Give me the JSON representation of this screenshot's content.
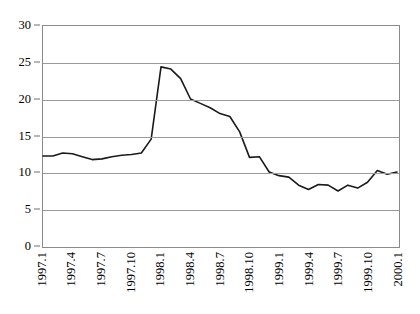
{
  "chart_data": {
    "type": "line",
    "title": "",
    "subtitle": "",
    "xlabel": "",
    "ylabel": "",
    "ylim": [
      0,
      30
    ],
    "ytick_labels": [
      "0",
      "5",
      "10",
      "15",
      "20",
      "25",
      "30"
    ],
    "yticks": [
      0,
      5,
      10,
      15,
      20,
      25,
      30
    ],
    "grid": true,
    "grid_axis": "y",
    "legend": false,
    "legend_position": "none",
    "line_color": "#1a1a1a",
    "grid_color": "#9a9a9a",
    "frame_color": "#8a8a8a",
    "background_color": "#ffffff",
    "x_tick_labels": [
      "1997.1",
      "1997.4",
      "1997.7",
      "1997.10",
      "1998.1",
      "1998.4",
      "1998.7",
      "1998.10",
      "1999.1",
      "1999.4",
      "1999.7",
      "1999.10",
      "2000.1"
    ],
    "x": [
      "1997.1",
      "1997.2",
      "1997.3",
      "1997.4",
      "1997.5",
      "1997.6",
      "1997.7",
      "1997.8",
      "1997.9",
      "1997.10",
      "1997.11",
      "1997.12",
      "1998.1",
      "1998.2",
      "1998.3",
      "1998.4",
      "1998.5",
      "1998.6",
      "1998.7",
      "1998.8",
      "1998.9",
      "1998.10",
      "1998.11",
      "1998.12",
      "1999.1",
      "1999.2",
      "1999.3",
      "1999.4",
      "1999.5",
      "1999.6",
      "1999.7",
      "1999.8",
      "1999.9",
      "1999.10",
      "1999.11",
      "1999.12",
      "2000.1"
    ],
    "values": [
      12.2,
      12.2,
      12.6,
      12.5,
      12.1,
      11.7,
      11.8,
      12.1,
      12.3,
      12.4,
      12.6,
      14.5,
      24.4,
      24.1,
      22.8,
      20.0,
      19.4,
      18.8,
      18.0,
      17.6,
      15.5,
      12.0,
      12.1,
      10.0,
      9.5,
      9.3,
      8.2,
      7.6,
      8.3,
      8.2,
      7.4,
      8.2,
      7.8,
      8.6,
      10.2,
      9.7,
      10.0
    ]
  }
}
